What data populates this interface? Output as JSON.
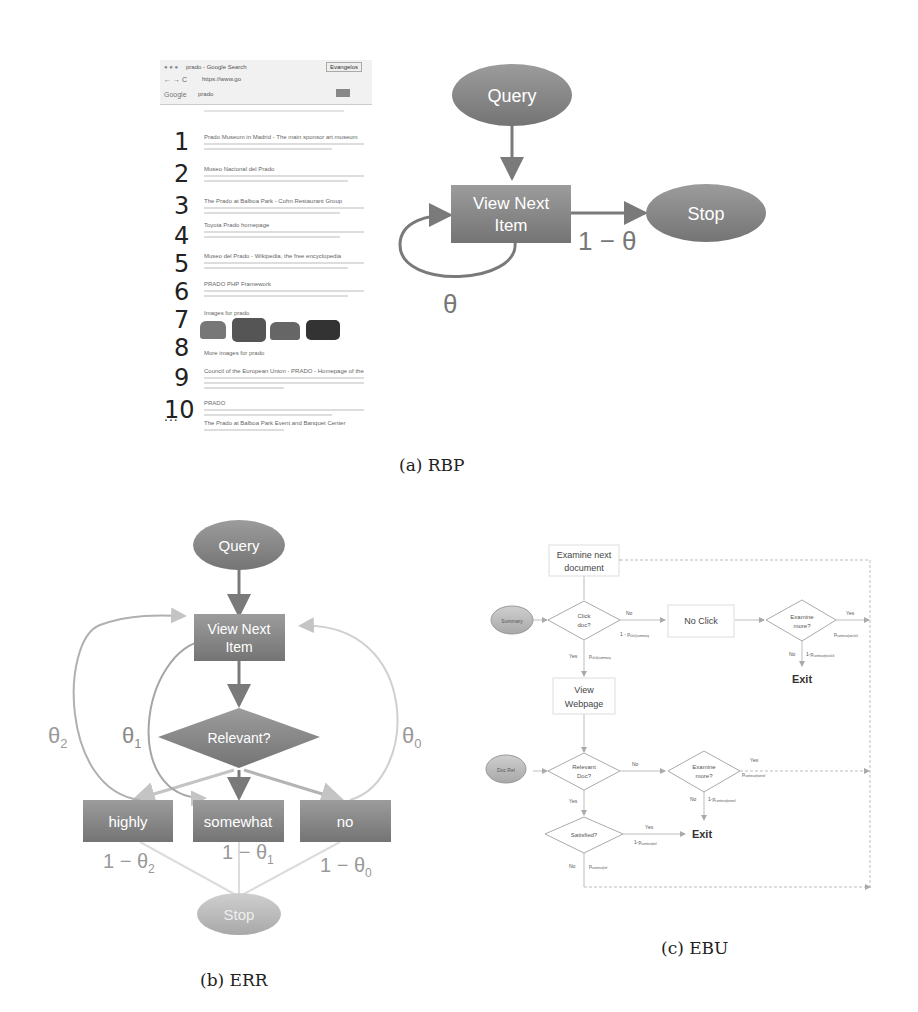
{
  "figure": {
    "panels": [
      {
        "id": "a",
        "caption": "(a) RBP",
        "serp": {
          "tab_label": "prado - Google Search",
          "profile_button": "Evangelos",
          "address": "https://www.go",
          "search_logo": "Google",
          "query": "prado",
          "result_numbers": [
            "1",
            "2",
            "3",
            "4",
            "5",
            "6",
            "7",
            "8",
            "9",
            "10"
          ],
          "ellipsis": "...",
          "results": [
            "Prado Museum in Madrid - The main sponsor art museum",
            "Museo Nacional del Prado",
            "The Prado at Balboa Park - Cohn Restaurant Group",
            "Toyota Prado homepage",
            "Museo del Prado - Wikipedia, the free encyclopedia",
            "PRADO PHP Framework",
            "Images for prado",
            "More images for prado",
            "Council of the European Union - PRADO - Homepage of the",
            "PRADO",
            "The Prado at Balboa Park Event and Banquet Center"
          ]
        },
        "nodes": {
          "query": "Query",
          "view_next_line1": "View Next",
          "view_next_line2": "Item",
          "stop": "Stop"
        },
        "edge_labels": {
          "loop": "θ",
          "exit": "1 − θ"
        }
      },
      {
        "id": "b",
        "caption": "(b) ERR",
        "nodes": {
          "query": "Query",
          "view_next_line1": "View Next",
          "view_next_line2": "Item",
          "relevant": "Relevant?",
          "highly": "highly",
          "somewhat": "somewhat",
          "no": "no",
          "stop": "Stop"
        },
        "edge_labels": {
          "theta2": "θ",
          "theta2_sub": "2",
          "theta1": "θ",
          "theta1_sub": "1",
          "theta0": "θ",
          "theta0_sub": "0",
          "stop2": "1 − θ",
          "stop2_sub": "2",
          "stop1": "1 − θ",
          "stop1_sub": "1",
          "stop0": "1 − θ",
          "stop0_sub": "0"
        }
      },
      {
        "id": "c",
        "caption": "(c) EBU",
        "nodes": {
          "examine_next_line1": "Examine next",
          "examine_next_line2": "document",
          "summary": "Summary",
          "click_doc_line1": "Click",
          "click_doc_line2": "doc?",
          "no_click": "No Click",
          "examine_more1_line1": "Examine",
          "examine_more1_line2": "more?",
          "exit1": "Exit",
          "view_webpage_line1": "View",
          "view_webpage_line2": "Webpage",
          "doc_rel": "Doc Rel",
          "relevant_doc_line1": "Relevant",
          "relevant_doc_line2": "Doc?",
          "examine_more2_line1": "Examine",
          "examine_more2_line2": "more?",
          "satisfied": "Satisfied?",
          "exit2": "Exit"
        },
        "edge_labels": {
          "click_no": "No",
          "click_no_prob": "1 - p",
          "click_no_prob_sub": "click|summary",
          "click_yes": "Yes",
          "click_yes_prob": "p",
          "click_yes_prob_sub": "click|summary",
          "more1_yes": "Yes",
          "more1_yes_prob": "p",
          "more1_yes_prob_sub": "continue|noclick",
          "more1_no": "No",
          "more1_no_prob": "1-p",
          "more1_no_prob_sub": "continue|noclick",
          "rel_no": "No",
          "rel_yes": "Yes",
          "more2_yes": "Yes",
          "more2_yes_prob": "p",
          "more2_yes_prob_sub": "continue|nonrel",
          "more2_no": "No",
          "more2_no_prob": "1-p",
          "more2_no_prob_sub": "continue|nonrel",
          "sat_yes": "Yes",
          "sat_yes_prob": "1-p",
          "sat_yes_prob_sub": "continue|rel",
          "sat_no": "No",
          "sat_no_prob": "p",
          "sat_no_prob_sub": "continue|rel"
        }
      }
    ]
  },
  "colors": {
    "node_fill": "#8a8a8a",
    "node_light": "#b5b5b5",
    "edge": "#7a7a7a",
    "edge_light": "#c9c9c9",
    "ebu_line": "#bdbdbd",
    "text_dark": "#222222"
  }
}
